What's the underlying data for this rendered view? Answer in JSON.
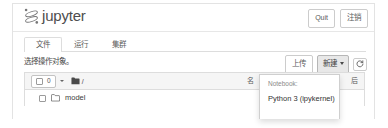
{
  "header": {
    "logo_icon": "jupyter-planet-icon",
    "brand": "jupyter",
    "quit_label": "Quit",
    "logout_label": "注销"
  },
  "tabs": [
    {
      "label": "文件",
      "name": "tab-files",
      "active": true
    },
    {
      "label": "运行",
      "name": "tab-running",
      "active": false
    },
    {
      "label": "集群",
      "name": "tab-clusters",
      "active": false
    }
  ],
  "actionbar": {
    "hint": "选择操作对象。",
    "upload_label": "上传",
    "new_label": "新建",
    "refresh_icon": "refresh-icon",
    "caret_icon": "chevron-down-icon"
  },
  "filelist": {
    "select_count": "0",
    "select_caret_icon": "chevron-down-icon",
    "folder_icon": "folder-icon",
    "path": "/",
    "col_name": "名",
    "col_modified": "后",
    "rows": [
      {
        "name": "model",
        "icon": "folder-outline-icon",
        "checked": false
      }
    ]
  },
  "dropdown": {
    "section_label": "Notebook:",
    "items": [
      {
        "label": "Python 3 (ipykernel)"
      }
    ]
  },
  "colors": {
    "brand_text": "#4e4e4e",
    "border": "#dddddd",
    "header_bg": "#f5f5f5",
    "active_button_bg": "#e8e8e8"
  }
}
